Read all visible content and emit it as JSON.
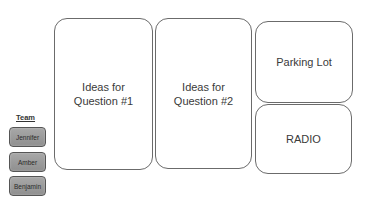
{
  "boards": [
    {
      "label": "Ideas for\nQuestion #1"
    },
    {
      "label": "Ideas for\nQuestion #2"
    },
    {
      "label": "Parking Lot"
    },
    {
      "label": "RADIO"
    }
  ],
  "team": {
    "label": "Team",
    "members": [
      {
        "name": "Jennifer"
      },
      {
        "name": "Amber"
      },
      {
        "name": "Benjamin"
      }
    ]
  }
}
